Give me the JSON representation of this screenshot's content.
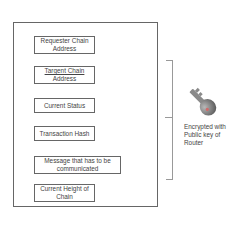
{
  "diagram": {
    "faint_labels": [
      "",
      ""
    ],
    "container": {
      "fields": [
        {
          "line1": "Requester Chain",
          "line2": "Address"
        },
        {
          "line1": "Targent Chain",
          "line2": "Address"
        },
        {
          "line1": "Current Status",
          "line2": ""
        },
        {
          "line1": "Transaction Hash",
          "line2": ""
        },
        {
          "line1": "Message that has to be",
          "line2": "communicated"
        },
        {
          "line1": "Current Height of",
          "line2": "Chain"
        }
      ]
    },
    "bracket": {
      "icon": "key-icon"
    },
    "caption": {
      "line1": "Encrypted with",
      "line2": "Public key of",
      "line3": "Router"
    },
    "colors": {
      "border": "#666666",
      "bracket": "#999999",
      "key": "#7a7a7a",
      "text": "#444444"
    }
  }
}
